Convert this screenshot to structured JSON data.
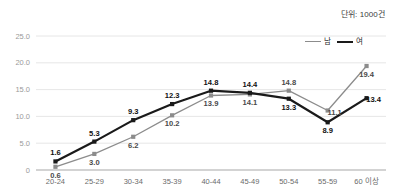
{
  "unit_note": "단위: 1000건",
  "legend": {
    "position": "top-right",
    "entries": [
      {
        "label": "남",
        "color": "#8c8c8c",
        "name": "male"
      },
      {
        "label": "여",
        "color": "#1a1a1a",
        "name": "female"
      }
    ]
  },
  "chart_data": {
    "type": "line",
    "title": "",
    "subtitle": "",
    "xlabel": "",
    "ylabel": "",
    "unit": "단위: 1000건",
    "grid": true,
    "legend_position": "top-right",
    "categories": [
      "20-24",
      "25-29",
      "30-34",
      "35-39",
      "40-44",
      "45-49",
      "50-54",
      "55-59",
      "60 이상"
    ],
    "ylim": [
      0,
      25
    ],
    "yticks": [
      0,
      5,
      10,
      15,
      20,
      25
    ],
    "ytick_labels": [
      "0",
      "5.0",
      "10.0",
      "15.0",
      "20.0",
      "25.0"
    ],
    "series": [
      {
        "name": "남",
        "color": "#8c8c8c",
        "marker": "square",
        "values": [
          0.6,
          3.0,
          6.2,
          10.2,
          13.9,
          14.1,
          14.8,
          11.1,
          19.4
        ],
        "labels": [
          "0.6",
          "3.0",
          "6.2",
          "10.2",
          "13.9",
          "14.1",
          "14.8",
          "11.1",
          "19.4"
        ],
        "label_positions": [
          "below",
          "below",
          "below",
          "below",
          "below",
          "below",
          "above",
          "right",
          "below"
        ]
      },
      {
        "name": "여",
        "color": "#1a1a1a",
        "marker": "square",
        "values": [
          1.6,
          5.3,
          9.3,
          12.3,
          14.8,
          14.4,
          13.3,
          8.9,
          13.4
        ],
        "labels": [
          "1.6",
          "5.3",
          "9.3",
          "12.3",
          "14.8",
          "14.4",
          "13.3",
          "8.9",
          "13.4"
        ],
        "label_positions": [
          "above",
          "above",
          "above",
          "above",
          "above",
          "above",
          "below",
          "below",
          "right"
        ]
      }
    ]
  }
}
